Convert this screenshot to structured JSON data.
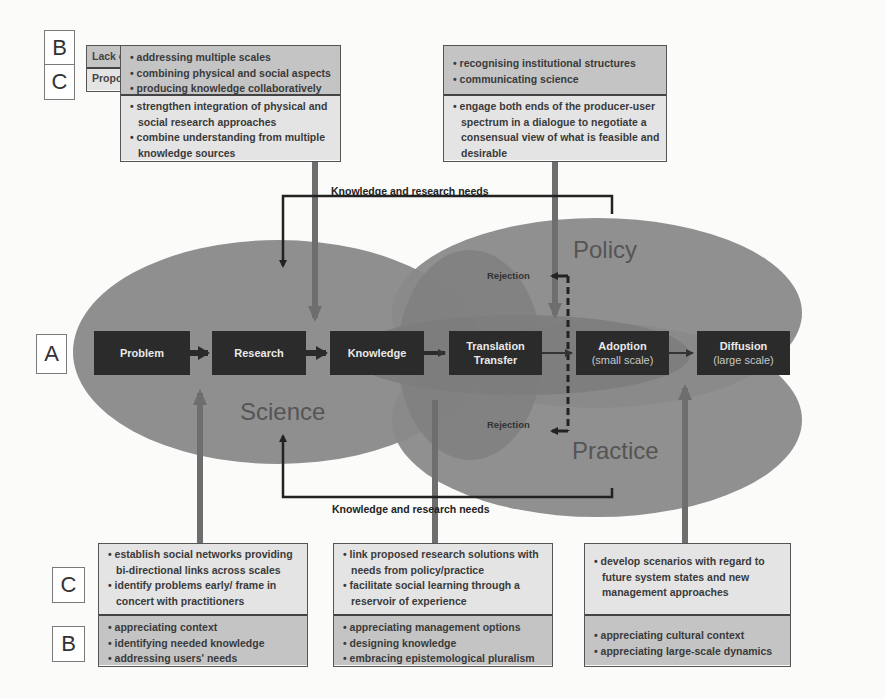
{
  "legend": {
    "labels": {
      "b": "B",
      "c": "C",
      "a": "A"
    },
    "lack_of": "Lack of...",
    "proposed_to": "Proposed to..."
  },
  "spheres": {
    "science": "Science",
    "policy": "Policy",
    "practice": "Practice"
  },
  "flow": [
    {
      "title": "Problem",
      "sub": ""
    },
    {
      "title": "Research",
      "sub": ""
    },
    {
      "title": "Knowledge",
      "sub": ""
    },
    {
      "title": "Translation",
      "sub": "Transfer"
    },
    {
      "title": "Adoption",
      "sub": "(small scale)"
    },
    {
      "title": "Diffusion",
      "sub": "(large scale)"
    }
  ],
  "feedback": {
    "top": "Knowledge and research needs",
    "bottom": "Knowledge and research needs",
    "rejection_top": "Rejection",
    "rejection_bottom": "Rejection"
  },
  "top_panels": [
    {
      "lack": [
        "addressing multiple scales",
        "combining physical and social aspects",
        "producing knowledge collaboratively"
      ],
      "proposed": [
        "strengthen integration of physical and social research approaches",
        "combine understanding from multiple knowledge sources"
      ]
    },
    {
      "lack": [
        "recognising institutional structures",
        "communicating science"
      ],
      "proposed": [
        "engage both ends of the producer-user spectrum in a dialogue to negotiate a consensual view of what is feasible and desirable"
      ]
    }
  ],
  "bottom_panels": [
    {
      "proposed": [
        "establish social networks providing bi-directional links across scales",
        "identify problems early/ frame in concert with practitioners"
      ],
      "lack": [
        "appreciating context",
        "identifying needed knowledge",
        "addressing users' needs"
      ]
    },
    {
      "proposed": [
        "link proposed research solutions with needs from policy/practice",
        "facilitate social learning through a reservoir of experience"
      ],
      "lack": [
        "appreciating management options",
        "designing knowledge",
        "embracing epistemological pluralism"
      ]
    },
    {
      "proposed": [
        "develop scenarios with regard to future system states and new management approaches"
      ],
      "lack": [
        "appreciating cultural context",
        "appreciating large-scale dynamics"
      ]
    }
  ],
  "colors": {
    "sphere_fill": "#8d8d8d",
    "overlap_fill": "#7a7a7a",
    "flow_box": "#2b2b2b",
    "lack_fill": "#c4c4c4",
    "proposed_fill": "#e4e4e4",
    "connector": "#6e6e6e"
  }
}
